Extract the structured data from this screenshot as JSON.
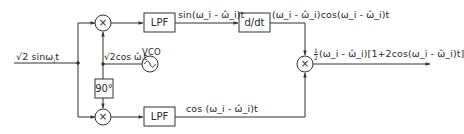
{
  "diagram": {
    "type": "block-diagram",
    "title": "",
    "input_signal": "√2 sinω_i t",
    "vco_output": "√2cos ω̂_i t",
    "blocks": {
      "multiplier_top": "×",
      "multiplier_bottom": "×",
      "multiplier_right": "×",
      "phase_shift": "90°",
      "lpf_top": "LPF",
      "lpf_bottom": "LPF",
      "differentiator": "d/dt",
      "vco": "VCO"
    },
    "signals": {
      "input": "√2 sinω",
      "input_sub": "i",
      "input_tail": "t",
      "vco_out": "√2cos ω̂",
      "vco_out_sub": "i",
      "vco_out_tail": "t",
      "lpf_top_out": "sin(ω_i - ω̂_i)t",
      "ddt_out": "(ω_i - ω̂_i)cos(ω_i - ω̂_i)t",
      "lpf_bottom_out": "cos (ω_i - ω̂_i)t",
      "output_frac_num": "1",
      "output_frac_den": "2",
      "output": "(ω_i - ω̂_i)[1+2cos(ω_i - ω̂_i)t]"
    },
    "edges": [
      {
        "from": "input",
        "to": "split"
      },
      {
        "from": "split",
        "to": "multiplier_top"
      },
      {
        "from": "split",
        "to": "multiplier_bottom"
      },
      {
        "from": "vco",
        "to": "multiplier_top"
      },
      {
        "from": "vco",
        "to": "phase_shift"
      },
      {
        "from": "phase_shift",
        "to": "multiplier_bottom"
      },
      {
        "from": "multiplier_top",
        "to": "lpf_top"
      },
      {
        "from": "multiplier_bottom",
        "to": "lpf_bottom"
      },
      {
        "from": "lpf_top",
        "to": "differentiator"
      },
      {
        "from": "differentiator",
        "to": "multiplier_right"
      },
      {
        "from": "lpf_bottom",
        "to": "multiplier_right"
      },
      {
        "from": "multiplier_right",
        "to": "output"
      }
    ],
    "colors": {
      "line": "#333333",
      "background": "#ffffff"
    }
  }
}
